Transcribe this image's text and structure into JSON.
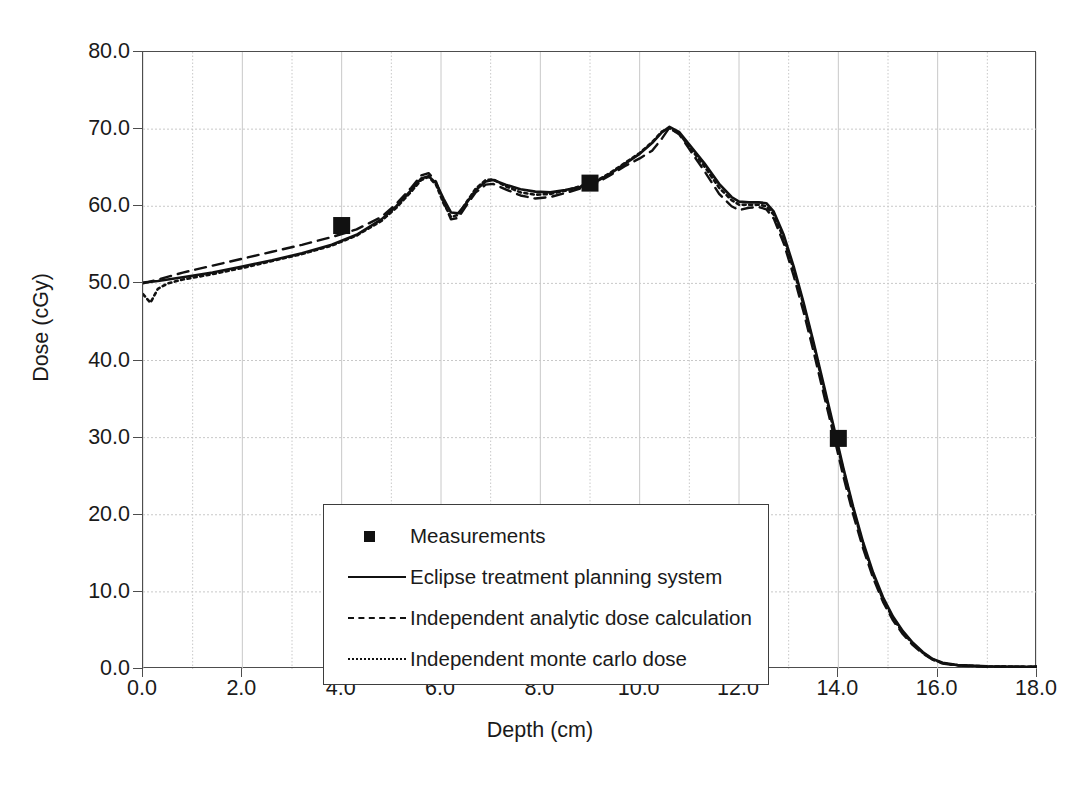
{
  "chart_data": {
    "type": "line",
    "title": "",
    "xlabel": "Depth (cm)",
    "ylabel": "Dose (cGy)",
    "xlim": [
      0.0,
      18.0
    ],
    "ylim": [
      0.0,
      80.0
    ],
    "xticks": [
      "0.0",
      "2.0",
      "4.0",
      "6.0",
      "8.0",
      "10.0",
      "12.0",
      "14.0",
      "16.0",
      "18.0"
    ],
    "xtick_values": [
      0,
      2,
      4,
      6,
      8,
      10,
      12,
      14,
      16,
      18
    ],
    "yticks": [
      "0.0",
      "10.0",
      "20.0",
      "30.0",
      "40.0",
      "50.0",
      "60.0",
      "70.0",
      "80.0"
    ],
    "ytick_values": [
      0,
      10,
      20,
      30,
      40,
      50,
      60,
      70,
      80
    ],
    "grid": "both, minor x every 1.0 cm, y every 10.0 cGy",
    "legend_position": "inside lower-left",
    "colors": {
      "line": "#111111",
      "grid": "#c8c8c8",
      "frame": "#4d4d4d"
    },
    "series": [
      {
        "name": "Measurements",
        "type": "scatter",
        "marker": "filled-square",
        "x": [
          4.0,
          9.0,
          14.0
        ],
        "y": [
          57.5,
          63.0,
          29.9
        ]
      },
      {
        "name": "Eclipse treatment planning system",
        "type": "line",
        "style": "solid",
        "x": [
          0.0,
          0.3,
          0.8,
          1.4,
          2.0,
          2.6,
          3.2,
          3.8,
          4.3,
          4.8,
          5.1,
          5.4,
          5.6,
          5.75,
          5.9,
          6.05,
          6.2,
          6.35,
          6.5,
          6.7,
          6.9,
          7.05,
          7.3,
          7.6,
          7.9,
          8.2,
          8.5,
          8.8,
          9.1,
          9.4,
          9.7,
          10.0,
          10.25,
          10.45,
          10.6,
          10.8,
          11.0,
          11.3,
          11.6,
          11.85,
          12.0,
          12.2,
          12.4,
          12.55,
          12.7,
          12.9,
          13.1,
          13.3,
          13.5,
          13.7,
          13.9,
          14.1,
          14.3,
          14.5,
          14.7,
          14.9,
          15.1,
          15.3,
          15.5,
          15.7,
          15.9,
          16.1,
          16.4,
          17.0,
          17.6,
          18.0
        ],
        "y": [
          50.1,
          50.3,
          50.8,
          51.4,
          52.2,
          53.0,
          53.9,
          55.0,
          56.3,
          58.3,
          60.0,
          62.1,
          63.6,
          63.9,
          63.0,
          61.0,
          59.2,
          59.1,
          60.3,
          62.1,
          63.2,
          63.4,
          62.8,
          62.2,
          61.9,
          61.8,
          62.1,
          62.5,
          63.1,
          64.2,
          65.5,
          66.8,
          68.2,
          69.6,
          70.3,
          69.6,
          68.0,
          65.6,
          62.9,
          61.2,
          60.6,
          60.5,
          60.5,
          60.4,
          59.3,
          56.3,
          52.2,
          47.5,
          42.4,
          37.0,
          31.6,
          26.1,
          21.0,
          16.4,
          12.5,
          9.3,
          6.8,
          4.9,
          3.4,
          2.2,
          1.3,
          0.8,
          0.5,
          0.35,
          0.3,
          0.3
        ]
      },
      {
        "name": "Independent analytic dose calculation",
        "type": "line",
        "style": "dashed",
        "x": [
          0.0,
          0.3,
          0.8,
          1.4,
          2.0,
          2.6,
          3.2,
          3.8,
          4.3,
          4.8,
          5.1,
          5.4,
          5.6,
          5.75,
          5.9,
          6.05,
          6.2,
          6.35,
          6.5,
          6.7,
          6.9,
          7.05,
          7.3,
          7.6,
          7.9,
          8.2,
          8.5,
          8.8,
          9.1,
          9.4,
          9.7,
          10.0,
          10.25,
          10.45,
          10.6,
          10.8,
          11.0,
          11.3,
          11.6,
          11.85,
          12.0,
          12.2,
          12.4,
          12.55,
          12.7,
          12.9,
          13.1,
          13.3,
          13.5,
          13.7,
          13.9,
          14.1,
          14.3,
          14.5,
          14.7,
          14.9,
          15.1,
          15.3,
          15.5,
          15.7,
          15.9,
          16.1,
          16.4,
          17.0,
          17.6,
          18.0
        ],
        "y": [
          50.0,
          50.5,
          51.4,
          52.3,
          53.2,
          54.1,
          55.0,
          56.0,
          57.0,
          58.6,
          60.3,
          62.4,
          64.0,
          64.3,
          63.2,
          60.6,
          58.3,
          58.5,
          60.0,
          61.8,
          62.8,
          62.9,
          62.2,
          61.4,
          61.0,
          61.2,
          61.7,
          62.3,
          62.9,
          64.0,
          65.2,
          66.2,
          67.2,
          68.8,
          70.2,
          69.3,
          67.4,
          64.6,
          61.6,
          60.0,
          59.5,
          59.8,
          59.9,
          59.6,
          58.4,
          55.2,
          51.0,
          46.3,
          41.2,
          35.8,
          30.5,
          25.0,
          20.0,
          15.6,
          11.8,
          8.7,
          6.3,
          4.5,
          3.1,
          2.0,
          1.2,
          0.7,
          0.45,
          0.3,
          0.3,
          0.3
        ]
      },
      {
        "name": "Independent monte carlo dose",
        "type": "line",
        "style": "dotted",
        "x": [
          0.0,
          0.15,
          0.3,
          0.5,
          0.8,
          1.4,
          2.0,
          2.6,
          3.2,
          3.8,
          4.3,
          4.8,
          5.1,
          5.4,
          5.6,
          5.75,
          5.9,
          6.05,
          6.2,
          6.35,
          6.5,
          6.7,
          6.9,
          7.05,
          7.3,
          7.6,
          7.9,
          8.2,
          8.5,
          8.8,
          9.1,
          9.4,
          9.7,
          10.0,
          10.25,
          10.45,
          10.6,
          10.8,
          11.0,
          11.3,
          11.6,
          11.85,
          12.0,
          12.2,
          12.4,
          12.55,
          12.7,
          12.9,
          13.1,
          13.3,
          13.5,
          13.7,
          13.9,
          14.1,
          14.3,
          14.5,
          14.7,
          14.9,
          15.1,
          15.3,
          15.5,
          15.7,
          15.9,
          16.1,
          16.4,
          17.0,
          17.6,
          18.0
        ],
        "y": [
          48.6,
          47.5,
          49.3,
          50.0,
          50.5,
          51.2,
          52.0,
          52.9,
          53.8,
          54.9,
          56.2,
          58.1,
          59.8,
          61.9,
          63.4,
          63.8,
          62.8,
          60.4,
          58.6,
          58.9,
          60.4,
          62.3,
          63.4,
          63.5,
          62.6,
          61.8,
          61.5,
          61.6,
          62.0,
          62.6,
          63.2,
          64.3,
          65.6,
          66.9,
          68.3,
          69.7,
          70.1,
          69.4,
          67.7,
          65.2,
          62.4,
          60.8,
          60.2,
          60.2,
          60.2,
          60.0,
          58.9,
          55.8,
          51.8,
          47.2,
          42.1,
          36.6,
          31.2,
          25.8,
          20.7,
          16.1,
          12.2,
          9.0,
          6.6,
          4.7,
          3.3,
          2.1,
          1.25,
          0.75,
          0.5,
          0.32,
          0.3,
          0.3
        ]
      }
    ]
  },
  "legend": {
    "entries": [
      {
        "label": "Measurements",
        "key": "square-marker-key"
      },
      {
        "label": "Eclipse treatment planning system",
        "key": "solid-line-key"
      },
      {
        "label": "Independent analytic dose calculation",
        "key": "dashed-line-key"
      },
      {
        "label": "Independent monte carlo dose",
        "key": "dotted-line-key"
      }
    ]
  },
  "axes": {
    "x_title": "Depth (cm)",
    "y_title": "Dose (cGy)",
    "x_tick_labels": [
      "0.0",
      "2.0",
      "4.0",
      "6.0",
      "8.0",
      "10.0",
      "12.0",
      "14.0",
      "16.0",
      "18.0"
    ],
    "y_tick_labels": [
      "0.0",
      "10.0",
      "20.0",
      "30.0",
      "40.0",
      "50.0",
      "60.0",
      "70.0",
      "80.0"
    ]
  }
}
